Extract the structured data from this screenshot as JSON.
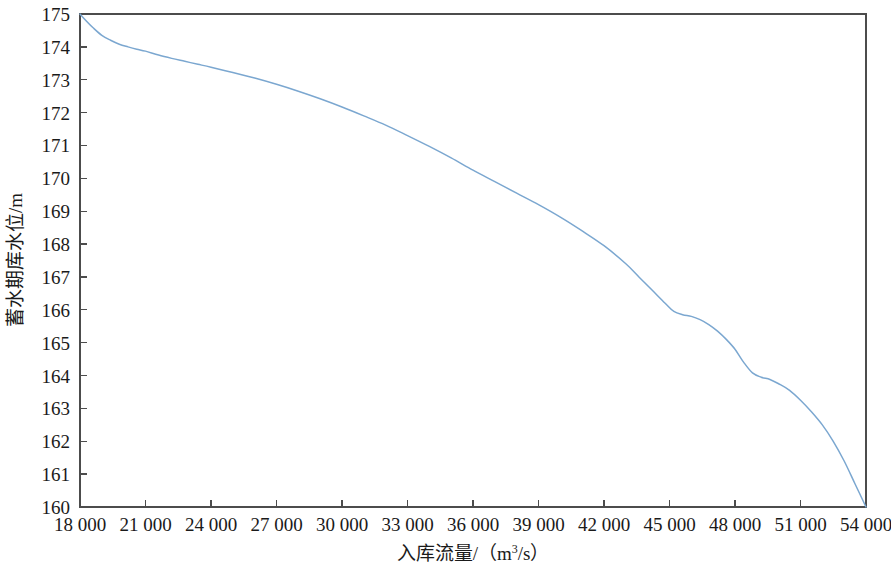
{
  "chart_data": {
    "type": "line",
    "title": "",
    "xlabel": "入库流量/（m³/s）",
    "ylabel": "蓄水期库水位/m",
    "xlabel_parts": {
      "base": "入库流量/（m",
      "sup": "3",
      "tail": "/s）"
    },
    "xlim": [
      18000,
      54000
    ],
    "ylim": [
      160,
      175
    ],
    "grid": false,
    "legend": null,
    "line_color": "#7ba7d0",
    "axis_color": "#4c4c4c",
    "x_ticks": [
      18000,
      21000,
      24000,
      27000,
      30000,
      33000,
      36000,
      39000,
      42000,
      45000,
      48000,
      51000,
      54000
    ],
    "x_tick_labels": [
      "18 000",
      "21 000",
      "24 000",
      "27 000",
      "30 000",
      "33 000",
      "36 000",
      "39 000",
      "42 000",
      "45 000",
      "48 000",
      "51 000",
      "54 000"
    ],
    "y_ticks": [
      160,
      161,
      162,
      163,
      164,
      165,
      166,
      167,
      168,
      169,
      170,
      171,
      172,
      173,
      174,
      175
    ],
    "y_tick_labels": [
      "160",
      "161",
      "162",
      "163",
      "164",
      "165",
      "166",
      "167",
      "168",
      "169",
      "170",
      "171",
      "172",
      "173",
      "174",
      "175"
    ],
    "series": [
      {
        "name": "蓄水期库水位",
        "x": [
          18000,
          18300,
          18600,
          19000,
          19400,
          19800,
          20200,
          20600,
          21000,
          21600,
          22200,
          22800,
          23400,
          24000,
          25000,
          26000,
          27000,
          28000,
          29000,
          30000,
          31000,
          32000,
          33000,
          34000,
          35000,
          36000,
          37000,
          38000,
          39000,
          40000,
          41000,
          42000,
          43000,
          43600,
          44200,
          44800,
          45200,
          45600,
          46000,
          46400,
          46800,
          47200,
          47600,
          48000,
          48400,
          48800,
          49200,
          49600,
          50000,
          50500,
          51000,
          51500,
          52000,
          52500,
          53000,
          53500,
          54000
        ],
        "values": [
          175.0,
          174.78,
          174.58,
          174.35,
          174.2,
          174.08,
          174.0,
          173.93,
          173.87,
          173.75,
          173.65,
          173.56,
          173.47,
          173.38,
          173.22,
          173.05,
          172.86,
          172.65,
          172.42,
          172.17,
          171.9,
          171.62,
          171.3,
          170.97,
          170.62,
          170.25,
          169.9,
          169.55,
          169.2,
          168.82,
          168.4,
          167.95,
          167.4,
          167.0,
          166.6,
          166.2,
          165.95,
          165.85,
          165.8,
          165.7,
          165.55,
          165.35,
          165.1,
          164.8,
          164.4,
          164.08,
          163.95,
          163.88,
          163.75,
          163.55,
          163.25,
          162.9,
          162.5,
          162.0,
          161.4,
          160.7,
          160.0
        ]
      }
    ],
    "annotations": []
  }
}
